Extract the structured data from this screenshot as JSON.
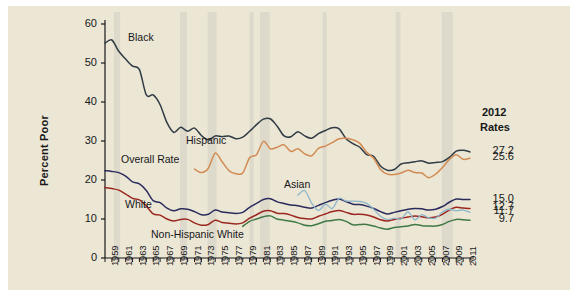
{
  "figure": {
    "background_color": "#ece6d4",
    "page_color": "#ffffff"
  },
  "end_block": {
    "heading_line1": "2012",
    "heading_line2": "Rates"
  },
  "chart_data": {
    "type": "line",
    "title": "",
    "subtitle": "",
    "xlabel": "",
    "ylabel": "Percent Poor",
    "xlim": [
      1959,
      2012
    ],
    "ylim": [
      0,
      60
    ],
    "ytick_values": [
      0,
      10,
      20,
      30,
      40,
      50,
      60
    ],
    "ytick_labels": [
      "0",
      "10",
      "20",
      "30",
      "40",
      "50",
      "60"
    ],
    "grid": false,
    "legend_position": "inline-annotations",
    "xtick_labels": [
      "1959",
      "1961",
      "1963",
      "1965",
      "1967",
      "1969",
      "1971",
      "1973",
      "1975",
      "1977",
      "1979",
      "1981",
      "1983",
      "1985",
      "1987",
      "1989",
      "1991",
      "1993",
      "1995",
      "1997",
      "1999",
      "2001",
      "2003",
      "2005",
      "2007",
      "2009",
      "2011"
    ],
    "xtick_minor_every_year": true,
    "x": [
      1959,
      1960,
      1961,
      1962,
      1963,
      1964,
      1965,
      1966,
      1967,
      1968,
      1969,
      1970,
      1971,
      1972,
      1973,
      1974,
      1975,
      1976,
      1977,
      1978,
      1979,
      1980,
      1981,
      1982,
      1983,
      1984,
      1985,
      1986,
      1987,
      1988,
      1989,
      1990,
      1991,
      1992,
      1993,
      1994,
      1995,
      1996,
      1997,
      1998,
      1999,
      2000,
      2001,
      2002,
      2003,
      2004,
      2005,
      2006,
      2007,
      2008,
      2009,
      2010,
      2011,
      2012
    ],
    "series": [
      {
        "name": "Black",
        "label": "Black",
        "color": "#2f3b45",
        "end_value": 27.2,
        "end_label": "27.2",
        "start_year": 1959,
        "values": [
          55.1,
          55.9,
          53.0,
          51.0,
          49.2,
          48.3,
          41.8,
          41.8,
          39.3,
          34.7,
          32.2,
          33.5,
          32.5,
          33.3,
          31.4,
          30.3,
          31.3,
          31.1,
          31.3,
          30.6,
          31.0,
          32.5,
          34.2,
          35.6,
          35.7,
          33.8,
          31.3,
          31.1,
          32.4,
          31.3,
          30.7,
          31.9,
          32.7,
          33.4,
          33.1,
          30.6,
          29.3,
          28.4,
          26.5,
          26.1,
          23.6,
          22.5,
          22.7,
          24.1,
          24.4,
          24.7,
          24.9,
          24.3,
          24.5,
          24.7,
          25.8,
          27.4,
          27.6,
          27.2
        ]
      },
      {
        "name": "Hispanic",
        "label": "Hispanic",
        "color": "#d28b53",
        "end_value": 25.6,
        "end_label": "25.6",
        "start_year": 1972,
        "values": [
          null,
          null,
          null,
          null,
          null,
          null,
          null,
          null,
          null,
          null,
          null,
          null,
          null,
          22.8,
          21.9,
          23.0,
          26.9,
          24.7,
          22.4,
          21.6,
          21.8,
          25.7,
          26.5,
          29.9,
          28.0,
          28.4,
          29.0,
          27.3,
          28.0,
          26.7,
          26.2,
          28.1,
          28.7,
          29.6,
          30.6,
          30.7,
          30.3,
          29.4,
          27.1,
          25.6,
          22.7,
          21.5,
          21.4,
          21.8,
          22.5,
          21.9,
          21.8,
          20.6,
          21.5,
          23.2,
          25.3,
          26.5,
          25.3,
          25.6
        ]
      },
      {
        "name": "Overall Rate",
        "label": "Overall Rate",
        "color": "#2b2b5e",
        "end_value": 15.0,
        "end_label": "15.0",
        "start_year": 1959,
        "values": [
          22.4,
          22.2,
          21.9,
          21.0,
          19.5,
          19.0,
          17.3,
          14.7,
          14.2,
          12.8,
          12.1,
          12.6,
          12.5,
          11.9,
          11.1,
          11.2,
          12.3,
          11.8,
          11.6,
          11.4,
          11.7,
          13.0,
          14.0,
          15.0,
          15.2,
          14.4,
          14.0,
          13.6,
          13.4,
          13.0,
          12.8,
          13.5,
          14.2,
          14.8,
          15.1,
          14.5,
          13.8,
          13.7,
          13.3,
          12.7,
          11.9,
          11.3,
          11.7,
          12.1,
          12.5,
          12.7,
          12.6,
          12.3,
          12.5,
          13.2,
          14.3,
          15.1,
          15.0,
          15.0
        ]
      },
      {
        "name": "White",
        "label": "White",
        "color": "#9b2820",
        "end_value": 12.7,
        "end_label": "12.7",
        "start_year": 1959,
        "values": [
          18.1,
          17.8,
          17.4,
          16.4,
          15.3,
          14.9,
          13.3,
          11.3,
          11.0,
          10.0,
          9.5,
          9.9,
          9.9,
          9.0,
          8.4,
          8.6,
          9.7,
          9.1,
          8.9,
          8.7,
          9.0,
          10.2,
          11.1,
          12.0,
          12.1,
          11.5,
          11.4,
          11.0,
          10.4,
          10.1,
          10.0,
          10.7,
          11.3,
          11.9,
          12.2,
          11.7,
          11.2,
          11.2,
          11.0,
          10.5,
          9.8,
          9.5,
          9.9,
          10.2,
          10.5,
          10.8,
          10.6,
          10.3,
          10.5,
          11.2,
          12.3,
          13.0,
          12.8,
          12.7
        ]
      },
      {
        "name": "Asian",
        "label": "Asian",
        "color": "#8fb7cc",
        "end_value": 11.7,
        "end_label": "11.7",
        "start_year": 1987,
        "values": [
          null,
          null,
          null,
          null,
          null,
          null,
          null,
          null,
          null,
          null,
          null,
          null,
          null,
          null,
          null,
          null,
          null,
          null,
          null,
          null,
          null,
          null,
          null,
          null,
          null,
          null,
          null,
          null,
          16.1,
          17.3,
          14.1,
          12.2,
          13.8,
          12.7,
          15.3,
          14.6,
          14.6,
          14.5,
          14.0,
          12.5,
          10.7,
          9.9,
          10.2,
          10.0,
          11.8,
          9.8,
          11.1,
          10.3,
          10.2,
          11.8,
          12.5,
          12.1,
          12.3,
          11.7
        ]
      },
      {
        "name": "Non-Hispanic White",
        "label": "Non-Hispanic White",
        "color": "#3f7a46",
        "end_value": 9.7,
        "end_label": "9.7",
        "start_year": 1979,
        "values": [
          null,
          null,
          null,
          null,
          null,
          null,
          null,
          null,
          null,
          null,
          null,
          null,
          null,
          null,
          null,
          null,
          null,
          null,
          null,
          null,
          8.1,
          9.4,
          10.0,
          10.6,
          10.8,
          10.0,
          9.7,
          9.4,
          9.0,
          8.4,
          8.3,
          8.8,
          9.4,
          9.6,
          9.9,
          9.4,
          8.5,
          8.6,
          8.6,
          8.2,
          7.7,
          7.4,
          7.8,
          8.0,
          8.2,
          8.6,
          8.3,
          8.2,
          8.2,
          8.6,
          9.4,
          9.9,
          9.8,
          9.7
        ]
      }
    ],
    "annotations": [
      {
        "text": "Black",
        "x_px": 120,
        "y_px": 25
      },
      {
        "text": "Hispanic",
        "x_px": 178,
        "y_px": 128
      },
      {
        "text": "Overall Rate",
        "x_px": 113,
        "y_px": 147
      },
      {
        "text": "White",
        "x_px": 117,
        "y_px": 192
      },
      {
        "text": "Asian",
        "x_px": 276,
        "y_px": 172
      },
      {
        "text": "Non-Hispanic White",
        "x_px": 143,
        "y_px": 222
      }
    ],
    "recession_bands": [
      {
        "start": 1960.3,
        "end": 1961.2
      },
      {
        "start": 1969.9,
        "end": 1970.9
      },
      {
        "start": 1973.9,
        "end": 1975.2
      },
      {
        "start": 1980.0,
        "end": 1980.6
      },
      {
        "start": 1981.5,
        "end": 1982.9
      },
      {
        "start": 1990.6,
        "end": 1991.2
      },
      {
        "start": 2001.2,
        "end": 2001.9
      },
      {
        "start": 2007.9,
        "end": 2009.5
      }
    ]
  }
}
